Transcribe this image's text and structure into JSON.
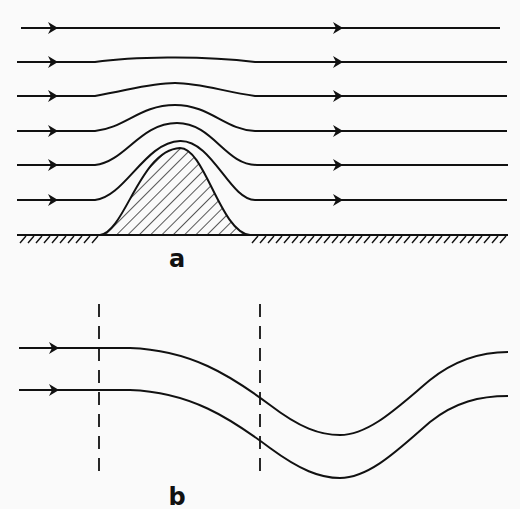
{
  "panel_a": {
    "label": "a",
    "streamlines": [
      {
        "y": 28,
        "bump": 0
      },
      {
        "y": 62,
        "bump": 5
      },
      {
        "y": 96,
        "bump": 13
      },
      {
        "y": 131,
        "bump": 26
      },
      {
        "y": 165,
        "bump": 42
      },
      {
        "y": 200,
        "bump": 54
      }
    ],
    "ground_y": 235,
    "hill_peak": {
      "x": 180,
      "y": 148
    },
    "arrow_x_left": 52,
    "arrow_x_right": 340
  },
  "panel_b": {
    "label": "b",
    "streamlines": [
      {
        "y": 348
      },
      {
        "y": 390
      }
    ],
    "dashed_lines_x": [
      99,
      260
    ]
  },
  "colors": {
    "ink": "#111111",
    "background": "#fafafa"
  }
}
